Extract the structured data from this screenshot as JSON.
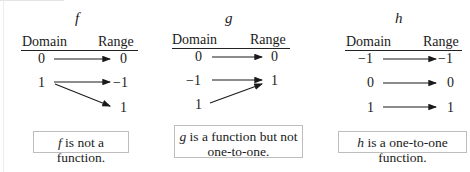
{
  "diagrams": [
    {
      "name": "f",
      "headers": {
        "domain": "Domain",
        "range": "Range"
      },
      "domain": [
        "0",
        "1"
      ],
      "range": [
        "0",
        "−1",
        "1"
      ],
      "mappings": [
        [
          "0",
          "0"
        ],
        [
          "1",
          "−1"
        ],
        [
          "1",
          "1"
        ]
      ],
      "note_var": "f",
      "note_text": " is not a function.",
      "note_line2": ""
    },
    {
      "name": "g",
      "headers": {
        "domain": "Domain",
        "range": "Range"
      },
      "domain": [
        "0",
        "−1",
        "1"
      ],
      "range": [
        "0",
        "1"
      ],
      "mappings": [
        [
          "0",
          "0"
        ],
        [
          "−1",
          "1"
        ],
        [
          "1",
          "1"
        ]
      ],
      "note_var": "g",
      "note_text": " is a function but not",
      "note_line2": "one-to-one."
    },
    {
      "name": "h",
      "headers": {
        "domain": "Domain",
        "range": "Range"
      },
      "domain": [
        "−1",
        "0",
        "1"
      ],
      "range": [
        "−1",
        "0",
        "1"
      ],
      "mappings": [
        [
          "−1",
          "−1"
        ],
        [
          "0",
          "0"
        ],
        [
          "1",
          "1"
        ]
      ],
      "note_var": "h",
      "note_text": " is a one-to-one function.",
      "note_line2": ""
    }
  ],
  "colors": {
    "ink": "#1a1a1a",
    "box_border": "#bdbdbd",
    "background": "#ffffff"
  }
}
